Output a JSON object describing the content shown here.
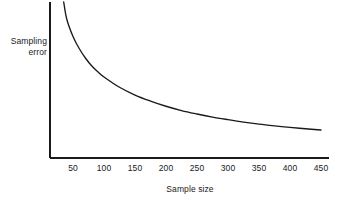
{
  "chart_data": {
    "type": "line",
    "title": "",
    "xlabel": "Sample size",
    "ylabel": "Sampling error",
    "ylabel_lines": [
      "Sampling",
      "error"
    ],
    "xticks": [
      50,
      100,
      150,
      200,
      250,
      300,
      350,
      400,
      450
    ],
    "xtick_labels": [
      "50",
      "100",
      "150",
      "200",
      "250",
      "300",
      "350",
      "400",
      "450"
    ],
    "yticks": [],
    "ytick_labels": [],
    "xlim": [
      0,
      465
    ],
    "ylim": [
      0,
      1
    ],
    "grid": false,
    "legend": null,
    "annotations": [],
    "series": [
      {
        "name": "Sampling error vs sample size",
        "relationship": "inverse square root decay",
        "x": [
          35,
          40,
          50,
          60,
          70,
          80,
          90,
          100,
          125,
          150,
          175,
          200,
          225,
          250,
          275,
          300,
          325,
          350,
          375,
          400,
          425,
          450
        ],
        "y": [
          1.0,
          0.9,
          0.8,
          0.73,
          0.675,
          0.63,
          0.595,
          0.565,
          0.505,
          0.46,
          0.425,
          0.395,
          0.37,
          0.35,
          0.332,
          0.317,
          0.303,
          0.291,
          0.281,
          0.272,
          0.264,
          0.257
        ]
      }
    ],
    "colors": {
      "background": "#ffffff",
      "axis": "#1a1a1a",
      "curve": "#1a1a1a",
      "text": "#1a1a1a"
    }
  },
  "axes": {
    "y_axis_label_line1": "Sampling",
    "y_axis_label_line2": "error",
    "x_axis_title": "Sample size"
  }
}
